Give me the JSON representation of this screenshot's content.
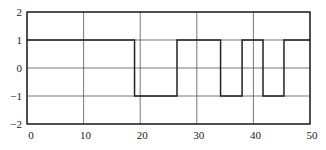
{
  "chart_data": {
    "type": "line",
    "title": "",
    "xlabel": "",
    "ylabel": "",
    "xlim": [
      0,
      50
    ],
    "ylim": [
      -2,
      2
    ],
    "grid": true,
    "legend": null,
    "x_ticks": [
      0,
      10,
      20,
      30,
      40,
      50
    ],
    "y_ticks": [
      2,
      1,
      0,
      -1,
      -2
    ],
    "x_tick_labels": [
      "0",
      "10",
      "20",
      "30",
      "40",
      "50"
    ],
    "y_tick_labels": [
      "2",
      "1",
      "0",
      "-1",
      "-2"
    ],
    "series": [
      {
        "name": "square wave",
        "style": "step",
        "color": "#222222",
        "x": [
          0,
          19,
          19,
          26.5,
          26.5,
          34.2,
          34.2,
          38,
          38,
          41.7,
          41.7,
          45.4,
          45.4,
          50
        ],
        "y": [
          1,
          1,
          -1,
          -1,
          1,
          1,
          -1,
          -1,
          1,
          1,
          -1,
          -1,
          1,
          1
        ]
      }
    ]
  },
  "colors": {
    "line": "#222222",
    "grid": "#555555",
    "frame": "#222222",
    "background": "#ffffff"
  }
}
